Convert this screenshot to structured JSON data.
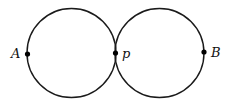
{
  "diagram": {
    "circles": [
      {
        "name": "left-circle"
      },
      {
        "name": "right-circle"
      }
    ],
    "points": [
      {
        "id": "A",
        "label": "A"
      },
      {
        "id": "p",
        "label": "p"
      },
      {
        "id": "B",
        "label": "B"
      }
    ]
  }
}
